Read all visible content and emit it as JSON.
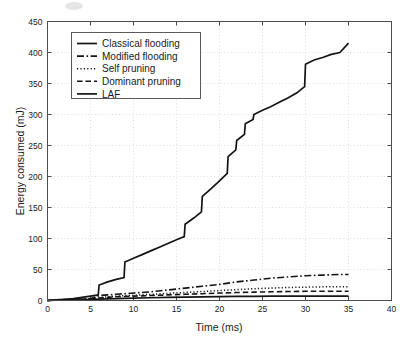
{
  "chart_data": {
    "type": "line",
    "title": "",
    "xlabel": "Time (ms)",
    "ylabel": "Energy consumed (mJ)",
    "xlim": [
      0,
      40
    ],
    "ylim": [
      0,
      450
    ],
    "xticks": [
      0,
      5,
      10,
      15,
      20,
      25,
      30,
      35,
      40
    ],
    "yticks": [
      0,
      50,
      100,
      150,
      200,
      250,
      300,
      350,
      400,
      450
    ],
    "xtick_labels": [
      "0",
      "5",
      "10",
      "15",
      "20",
      "25",
      "30",
      "35",
      "40"
    ],
    "ytick_labels": [
      "0",
      "50",
      "100",
      "150",
      "200",
      "250",
      "300",
      "350",
      "400",
      "450"
    ],
    "grid": true,
    "legend_position": "upper left",
    "series": [
      {
        "name": "Classical flooding",
        "style": "solid",
        "color": "#141414",
        "x": [
          0,
          1,
          2,
          3,
          4,
          5,
          5.9,
          6,
          7,
          8,
          8.9,
          9,
          10,
          11,
          12,
          13,
          14,
          15,
          15.9,
          16,
          17,
          17.9,
          18,
          19,
          20,
          20.9,
          21,
          21.9,
          22,
          22.9,
          23,
          23.9,
          24,
          25,
          26,
          27,
          28,
          29,
          29.9,
          30,
          31,
          32,
          33,
          34,
          35
        ],
        "y": [
          0,
          1,
          2,
          3,
          5,
          7,
          9,
          25,
          30,
          34,
          37,
          62,
          68,
          74,
          80,
          86,
          92,
          98,
          103,
          123,
          133,
          143,
          168,
          180,
          193,
          205,
          232,
          243,
          258,
          268,
          285,
          292,
          300,
          307,
          313,
          320,
          327,
          335,
          345,
          381,
          388,
          392,
          397,
          400,
          415
        ]
      },
      {
        "name": "Modified flooding",
        "style": "dashdot",
        "color": "#141414",
        "x": [
          0,
          1,
          2,
          3,
          4,
          5,
          6,
          7,
          8,
          9,
          10,
          12,
          14,
          16,
          18,
          20,
          22,
          24,
          26,
          28,
          30,
          32,
          34,
          35
        ],
        "y": [
          0,
          1,
          1.5,
          2,
          2.5,
          3,
          8,
          9,
          10,
          11,
          12,
          14,
          17,
          20,
          23,
          26,
          30,
          33,
          36,
          38,
          40,
          41,
          42,
          42
        ]
      },
      {
        "name": "Self pruning",
        "style": "dotted",
        "color": "#141414",
        "x": [
          0,
          1,
          2,
          3,
          4,
          5,
          6,
          7,
          8,
          10,
          12,
          14,
          16,
          18,
          20,
          22,
          24,
          26,
          28,
          30,
          32,
          34,
          35
        ],
        "y": [
          0,
          0.8,
          1.2,
          1.6,
          2,
          2.5,
          5,
          6,
          7,
          8.5,
          10,
          11.5,
          13,
          14.5,
          16,
          17.5,
          19,
          20,
          21,
          21.5,
          22,
          22,
          22
        ]
      },
      {
        "name": "Dominant pruning",
        "style": "dashed",
        "color": "#141414",
        "x": [
          0,
          1,
          2,
          3,
          4,
          5,
          6,
          7,
          8,
          10,
          12,
          14,
          16,
          18,
          20,
          22,
          24,
          26,
          28,
          30,
          32,
          34,
          35
        ],
        "y": [
          0,
          0.6,
          1,
          1.4,
          1.8,
          2.2,
          4,
          5,
          6,
          7,
          8,
          9,
          10,
          11,
          12,
          12.8,
          13.5,
          14,
          14.4,
          14.8,
          15,
          15,
          15
        ]
      },
      {
        "name": "LAF",
        "style": "solid",
        "color": "#141414",
        "x": [
          0,
          1,
          2,
          3,
          4,
          5,
          6,
          8,
          10,
          12,
          14,
          16,
          18,
          20,
          22,
          24,
          26,
          28,
          30,
          32,
          34,
          35
        ],
        "y": [
          0,
          0.4,
          0.7,
          1,
          1.3,
          1.6,
          2.2,
          3,
          3.8,
          4.4,
          5,
          5.5,
          6,
          6.3,
          6.6,
          6.8,
          7,
          7,
          7,
          7,
          7,
          7
        ]
      }
    ]
  },
  "legend": {
    "entries": [
      {
        "label": "Classical flooding",
        "style": "solid"
      },
      {
        "label": "Modified flooding",
        "style": "dashdot"
      },
      {
        "label": "Self pruning",
        "style": "dotted"
      },
      {
        "label": "Dominant pruning",
        "style": "dashed"
      },
      {
        "label": "LAF",
        "style": "solid"
      }
    ]
  }
}
